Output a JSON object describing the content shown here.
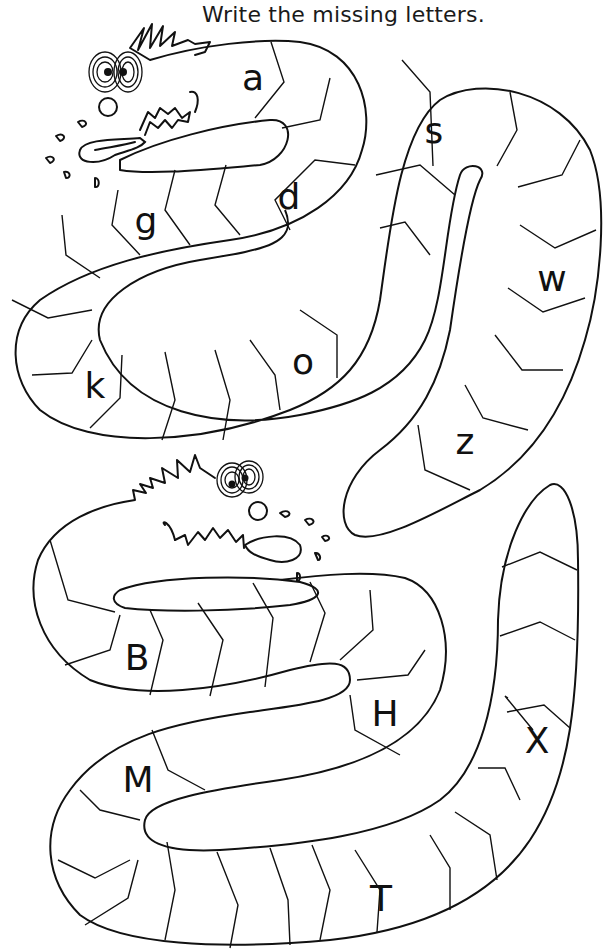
{
  "worksheet": {
    "instruction": "Write the missing letters.",
    "upper_snake": {
      "case": "lowercase",
      "letters": [
        {
          "char": "a",
          "x": 253,
          "y": 78
        },
        {
          "char": "d",
          "x": 289,
          "y": 197
        },
        {
          "char": "g",
          "x": 146,
          "y": 221
        },
        {
          "char": "k",
          "x": 95,
          "y": 386
        },
        {
          "char": "o",
          "x": 303,
          "y": 362
        },
        {
          "char": "s",
          "x": 434,
          "y": 131
        },
        {
          "char": "w",
          "x": 552,
          "y": 279
        },
        {
          "char": "z",
          "x": 465,
          "y": 442
        }
      ]
    },
    "lower_snake": {
      "case": "uppercase",
      "letters": [
        {
          "char": "B",
          "x": 137,
          "y": 658
        },
        {
          "char": "H",
          "x": 385,
          "y": 714
        },
        {
          "char": "M",
          "x": 138,
          "y": 780
        },
        {
          "char": "T",
          "x": 381,
          "y": 899
        },
        {
          "char": "X",
          "x": 537,
          "y": 741
        }
      ]
    }
  }
}
